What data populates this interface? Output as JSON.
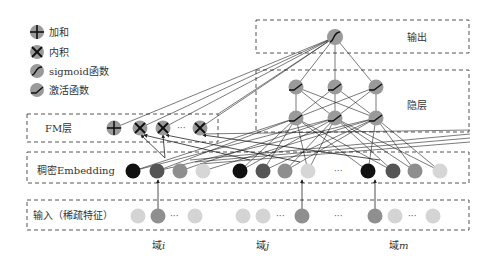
{
  "legend": {
    "items": [
      {
        "icon": "plus-icon",
        "label": "加和"
      },
      {
        "icon": "cross-icon",
        "label": "内积"
      },
      {
        "icon": "sigmoid-icon",
        "label": "sigmoid函数"
      },
      {
        "icon": "activation-icon",
        "label": "激活函数"
      }
    ]
  },
  "layers": {
    "output": "输出",
    "hidden": "隐层",
    "fm": "FM层",
    "embedding": "稠密Embedding",
    "input": "输入（稀疏特征）"
  },
  "fields": {
    "i": {
      "prefix": "域",
      "var": "i"
    },
    "j": {
      "prefix": "域",
      "var": "j"
    },
    "m": {
      "prefix": "域",
      "var": "m"
    }
  },
  "ellipsis": "···",
  "colors": {
    "node_gray": "#9a9a9a",
    "emb_1": "#111111",
    "emb_2": "#555555",
    "emb_3": "#8e8e8e",
    "emb_4": "#d6d6d6",
    "input_light": "#d4d4d4",
    "input_active": "#8f8f8f"
  }
}
